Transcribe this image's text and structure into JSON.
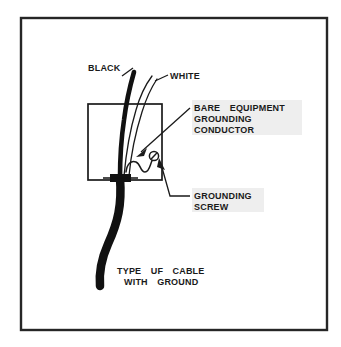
{
  "diagram": {
    "title_caption": {
      "line1": "TYPE  UF  CABLE",
      "line2": "WITH  GROUND"
    },
    "labels": {
      "black": "BLACK",
      "white": "WHITE",
      "bare_equipment": {
        "line1": "BARE  EQUIPMENT",
        "line2": "GROUNDING",
        "line3": "CONDUCTOR"
      },
      "grounding_screw": {
        "line1": "GROUNDING",
        "line2": "SCREW"
      }
    },
    "colors": {
      "ink": "#1a1a1a",
      "cable": "#111111",
      "background": "#ffffff",
      "label_tint": "#eeeeee",
      "border": "#262626"
    }
  }
}
